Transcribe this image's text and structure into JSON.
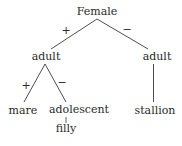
{
  "diagram": {
    "type": "tree",
    "root": {
      "label": "Female",
      "children": [
        {
          "edge": "+",
          "label": "adult",
          "children": [
            {
              "edge": "+",
              "label": "mare"
            },
            {
              "edge": "−",
              "label": "adolescent",
              "children": [
                {
                  "edge": "",
                  "label": "filly"
                }
              ]
            }
          ]
        },
        {
          "edge": "−",
          "label": "adult",
          "children": [
            {
              "edge": "",
              "label": "stallion"
            }
          ]
        }
      ]
    },
    "nodes": {
      "female": "Female",
      "adult_left": "adult",
      "adult_right": "adult",
      "mare": "mare",
      "adolescent": "adolescent",
      "filly": "filly",
      "stallion": "stallion"
    },
    "edges": {
      "female_to_adult_left": "+",
      "female_to_adult_right": "−",
      "adult_left_to_mare": "+",
      "adult_left_to_adolescent": "−"
    },
    "colors": {
      "line": "#3a3a3a",
      "text": "#2a2a2a",
      "background": "#ffffff"
    }
  }
}
